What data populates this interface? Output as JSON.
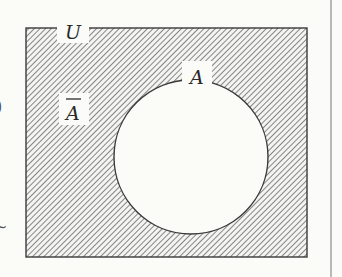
{
  "diagram": {
    "type": "venn",
    "title": "",
    "universe": {
      "label": "U",
      "shaded": true
    },
    "sets": [
      {
        "label": "A",
        "shaded": false
      }
    ],
    "complement": {
      "label": "A",
      "overline": true,
      "meaning": "complement of A"
    },
    "shaded_region": "U minus A (complement of A)",
    "colors": {
      "background": "#fbfbf8",
      "outline": "#3a3a3a",
      "hatch": "#6a6a6a",
      "rule": "#b8b8b8"
    },
    "edge_fragments": {
      "left_glyph_1": ")",
      "left_glyph_2": "~"
    }
  }
}
